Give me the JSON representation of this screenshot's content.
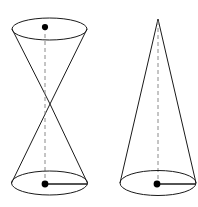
{
  "figure": {
    "background_color": "#ffffff",
    "stroke_color": "#1a1a1a",
    "axis_color": "#8a8a8a",
    "dot_color": "#000000",
    "canvas": {
      "width": 198,
      "height": 207
    },
    "shapes": [
      {
        "name": "double-cone",
        "label": "",
        "type": "bicone",
        "position": "left",
        "top_ellipse": {
          "cx": 49.5,
          "cy": 29,
          "rx": 37.5,
          "ry": 11
        },
        "bottom_ellipse": {
          "cx": 49.5,
          "cy": 183,
          "rx": 38,
          "ry": 12
        },
        "waist_apex": {
          "x": 50,
          "y": 104
        },
        "axis": {
          "x": 45,
          "y_top": 27,
          "y_bottom": 184,
          "style": "dashed"
        },
        "center_dots": [
          {
            "x": 45,
            "y": 27,
            "r": 3.1
          },
          {
            "x": 45,
            "y": 184,
            "r": 3.4
          }
        ],
        "radius_lines": [
          {
            "x1": 45,
            "y1": 184,
            "x2": 87.5,
            "y2": 184
          }
        ]
      },
      {
        "name": "single-cone",
        "label": "",
        "type": "cone",
        "position": "right",
        "apex": {
          "x": 158,
          "y": 19
        },
        "base_ellipse": {
          "cx": 158,
          "cy": 183,
          "rx": 38,
          "ry": 12.5
        },
        "axis": {
          "x": 158,
          "y_top": 21,
          "y_bottom": 184,
          "style": "dashed"
        },
        "center_dots": [
          {
            "x": 157,
            "y": 184,
            "r": 3.4
          }
        ],
        "radius_lines": [
          {
            "x1": 157,
            "y1": 184,
            "x2": 196,
            "y2": 184
          }
        ]
      }
    ]
  }
}
